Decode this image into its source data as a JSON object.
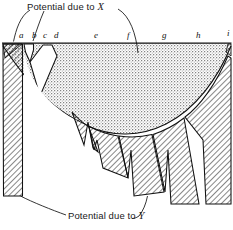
{
  "figure": {
    "title_x": "Potential due to X",
    "title_y": "Potential due to Y",
    "label_x_text": "Potential due to ",
    "label_x_var": "X",
    "label_y_text": "Potential due to ",
    "label_y_var": "Y",
    "colors": {
      "ink": "#111111",
      "stipple_fill": "#d9d9d9",
      "hatch_line": "#1a1a1a",
      "background": "#ffffff"
    },
    "markers": [
      {
        "id": "a",
        "label": "a",
        "x": 19,
        "y": 30
      },
      {
        "id": "b",
        "label": "b",
        "x": 32,
        "y": 30
      },
      {
        "id": "c",
        "label": "c",
        "x": 43,
        "y": 30
      },
      {
        "id": "d",
        "label": "d",
        "x": 54,
        "y": 30
      },
      {
        "id": "e",
        "label": "e",
        "x": 94,
        "y": 30
      },
      {
        "id": "f",
        "label": "f",
        "x": 127,
        "y": 30
      },
      {
        "id": "g",
        "label": "g",
        "x": 162,
        "y": 30
      },
      {
        "id": "h",
        "label": "h",
        "x": 196,
        "y": 30
      },
      {
        "id": "i",
        "label": "i",
        "x": 227,
        "y": 28
      }
    ]
  },
  "chart_data": {
    "type": "area",
    "xlabel": "",
    "ylabel": "",
    "xlim": [
      0,
      233
    ],
    "ylim": [
      230,
      0
    ],
    "grid": false,
    "legend": [
      "Potential due to X",
      "Potential due to Y"
    ],
    "annotations": [
      {
        "text": "Potential due to X",
        "x": 27,
        "y": 8,
        "leader_to": [
          [
            30,
            42
          ],
          [
            137,
            53
          ]
        ]
      },
      {
        "text": "Potential due to Y",
        "x": 68,
        "y": 216,
        "leader_to": [
          [
            20,
            196
          ],
          [
            148,
            196
          ]
        ]
      }
    ],
    "baseline_y": 43,
    "tick_letters": [
      "a",
      "b",
      "c",
      "d",
      "e",
      "f",
      "g",
      "h",
      "i"
    ],
    "tick_x": [
      19,
      32,
      43,
      54,
      94,
      127,
      162,
      196,
      227
    ],
    "series": [
      {
        "name": "Potential due to X",
        "note": "stippled region: between baseline y=43 and the bowl curve",
        "fill": "stipple",
        "x": [
          0,
          25,
          50,
          75,
          100,
          120,
          140,
          160,
          180,
          200,
          215,
          233
        ],
        "y": [
          43,
          60,
          78,
          95,
          110,
          117,
          119,
          114,
          100,
          78,
          60,
          43
        ]
      },
      {
        "name": "Potential due to Y",
        "note": "hatched wedges hanging below the bowl curve",
        "fill": "hatch",
        "x": [
          0,
          25,
          50,
          75,
          100,
          120,
          140,
          160,
          180,
          200,
          215,
          233
        ],
        "y": [
          196,
          150,
          128,
          140,
          160,
          178,
          188,
          192,
          196,
          196,
          196,
          120
        ]
      }
    ],
    "wedges": [
      {
        "id": "wedge-a",
        "left": 3,
        "right": 23,
        "bottom": 196
      },
      {
        "id": "wedge-b",
        "left": 24,
        "right": 34,
        "bottom": 62
      },
      {
        "id": "wedge-c",
        "left": 36,
        "right": 52,
        "bottom": 56
      },
      {
        "id": "wedge-d",
        "left": 56,
        "right": 100,
        "bottom": 145
      },
      {
        "id": "wedge-e",
        "left": 101,
        "right": 104,
        "bottom": 152
      },
      {
        "id": "wedge-f",
        "left": 106,
        "right": 132,
        "bottom": 178
      },
      {
        "id": "wedge-g",
        "left": 134,
        "right": 168,
        "bottom": 196
      },
      {
        "id": "wedge-h",
        "left": 171,
        "right": 203,
        "bottom": 204
      },
      {
        "id": "wedge-i",
        "left": 206,
        "right": 231,
        "bottom": 204
      }
    ]
  }
}
